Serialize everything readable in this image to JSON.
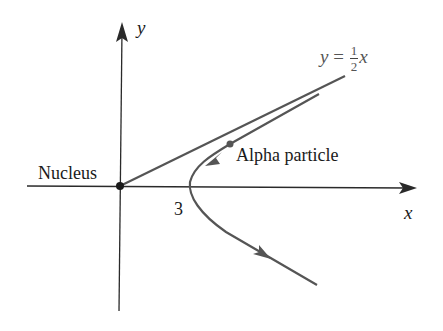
{
  "figure": {
    "labels": {
      "y_axis": "y",
      "x_axis": "x",
      "nucleus": "Nucleus",
      "vertex_value": "3",
      "particle": "Alpha particle",
      "asymptote_lhs": "y",
      "asymptote_eq": "=",
      "asymptote_num": "1",
      "asymptote_den": "2",
      "asymptote_var": "x"
    },
    "colors": {
      "axes": "#2a2a2a",
      "curve": "#555555",
      "text": "#1a1a1a"
    },
    "geometry": {
      "origin_px": [
        120,
        186
      ],
      "vertex_x_value": 3,
      "asymptote_slope": 0.5
    }
  }
}
